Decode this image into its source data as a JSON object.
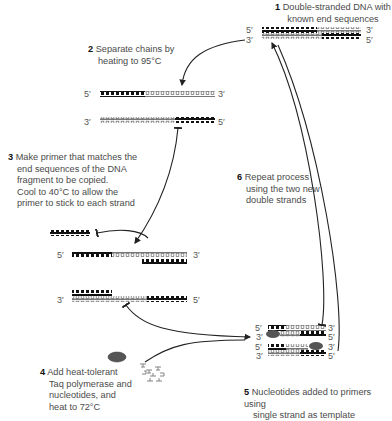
{
  "diagram": {
    "colors": {
      "template_strand": "#111111",
      "new_strand": "#888888",
      "enzyme": "#555555",
      "arrow": "#222222",
      "text": "#4a4a4a"
    },
    "steps": [
      {
        "number": "1",
        "lines": [
          "Double-stranded DNA with",
          "known end sequences"
        ]
      },
      {
        "number": "2",
        "lines": [
          "Separate chains by",
          "heating to 95°C"
        ]
      },
      {
        "number": "3",
        "lines": [
          "Make primer that matches the",
          "end sequences of the DNA",
          "fragment to be copied.",
          "Cool to 40°C to allow the",
          "primer to stick to each strand"
        ]
      },
      {
        "number": "4",
        "lines": [
          "Add heat-tolerant",
          "Taq polymerase and",
          "nucleotides, and",
          "heat to 72°C"
        ]
      },
      {
        "number": "5",
        "lines": [
          "Nucleotides added to primers using",
          "single strand as template"
        ]
      },
      {
        "number": "6",
        "lines": [
          "Repeat process",
          "using the two new",
          "double strands"
        ]
      }
    ],
    "strand_ends": {
      "five_prime": "5′",
      "three_prime": "3′"
    }
  }
}
